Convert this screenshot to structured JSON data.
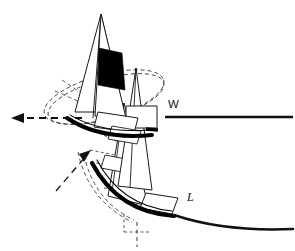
{
  "figure": {
    "background_color": "#ffffff",
    "ink_color": "#111111",
    "stroke_color": "#1a1a1a",
    "sail_fill": "#ffffff",
    "sail_band_color": "#000000",
    "hull_color": "#000000",
    "dash_color": "#333333"
  },
  "labels": {
    "windward": "W",
    "leeward": "L"
  },
  "annotations": {
    "windward_line_note": "straight horizontal reference line to the right of the upright boat",
    "leeward_line_note": "curved reference line sweeping down to the right of the heeled boat",
    "left_arrow_note": "dashed arrow pointing left from the heeled-to-windward hull",
    "diagonal_arrow_note": "dashed arrow pointing up-right toward the heeled-to-leeward hull",
    "vertical_dash_note": "dashed vertical centreline below the heeled-to-leeward hull",
    "ellipse_note": "dashed ellipse arc showing the mast-head swing path"
  },
  "geometry": {
    "windward_line": {
      "x1": 165,
      "y1": 117,
      "x2": 293,
      "y2": 117
    },
    "leeward_curve": {
      "start_x": 175,
      "start_y": 205,
      "end_x": 293,
      "end_y": 228
    },
    "left_arrow": {
      "tail_x": 82,
      "tail_y": 118,
      "head_x": 12,
      "head_y": 118
    },
    "diagonal_arrow": {
      "tail_x": 57,
      "tail_y": 190,
      "head_x": 90,
      "head_y": 152
    },
    "vertical_dashline": {
      "x": 137,
      "y1": 222,
      "y2": 246
    },
    "label_w_pos": {
      "x": 168,
      "y": 107
    },
    "label_l_pos": {
      "x": 187,
      "y": 200
    }
  },
  "parts": [
    {
      "name": "mainsail-heeled-windward",
      "kind": "sail"
    },
    {
      "name": "jib-heeled-windward",
      "kind": "sail"
    },
    {
      "name": "mainsail-black-band",
      "kind": "sail-band"
    },
    {
      "name": "hull-heeled-windward",
      "kind": "hull"
    },
    {
      "name": "mainsail-upright",
      "kind": "sail"
    },
    {
      "name": "hull-upright",
      "kind": "hull"
    },
    {
      "name": "mainsail-heeled-leeward",
      "kind": "sail"
    },
    {
      "name": "hull-heeled-leeward",
      "kind": "hull"
    },
    {
      "name": "masthead-swing-ellipse",
      "kind": "construction"
    }
  ]
}
